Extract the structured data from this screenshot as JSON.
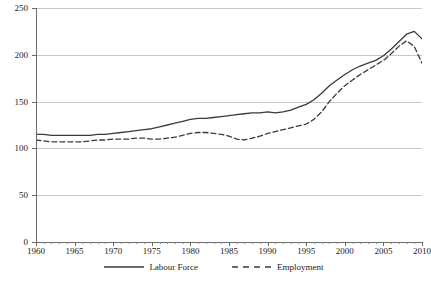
{
  "chart_data": {
    "type": "line",
    "title": "",
    "subtitle": "",
    "xlabel": "",
    "ylabel": "",
    "xlim": [
      1960,
      2010
    ],
    "ylim": [
      0,
      250
    ],
    "yticks": [
      0,
      50,
      100,
      150,
      200,
      250
    ],
    "xticks": [
      1960,
      1965,
      1970,
      1975,
      1980,
      1985,
      1990,
      1995,
      2000,
      2005,
      2010
    ],
    "x_minor_tick_step": 1,
    "grid": "horizontal",
    "legend_position": "bottom",
    "x": [
      1960,
      1961,
      1962,
      1963,
      1964,
      1965,
      1966,
      1967,
      1968,
      1969,
      1970,
      1971,
      1972,
      1973,
      1974,
      1975,
      1976,
      1977,
      1978,
      1979,
      1980,
      1981,
      1982,
      1983,
      1984,
      1985,
      1986,
      1987,
      1988,
      1989,
      1990,
      1991,
      1992,
      1993,
      1994,
      1995,
      1996,
      1997,
      1998,
      1999,
      2000,
      2001,
      2002,
      2003,
      2004,
      2005,
      2006,
      2007,
      2008,
      2009,
      2010
    ],
    "series": [
      {
        "name": "Labour Force",
        "style": "solid",
        "color": "#3a3a3a",
        "values": [
          115,
          115,
          114,
          114,
          114,
          114,
          114,
          114,
          115,
          115,
          116,
          117,
          118,
          119,
          120,
          121,
          123,
          125,
          127,
          129,
          131,
          132,
          132,
          133,
          134,
          135,
          136,
          137,
          138,
          138,
          139,
          138,
          139,
          141,
          144,
          147,
          152,
          159,
          167,
          173,
          179,
          184,
          188,
          191,
          194,
          199,
          206,
          214,
          222,
          225,
          217
        ]
      },
      {
        "name": "Employment",
        "style": "dashed",
        "color": "#3a3a3a",
        "values": [
          109,
          108,
          107,
          107,
          107,
          107,
          107,
          108,
          109,
          109,
          110,
          110,
          110,
          111,
          111,
          110,
          110,
          111,
          112,
          114,
          116,
          117,
          117,
          116,
          115,
          113,
          110,
          109,
          111,
          113,
          116,
          118,
          120,
          122,
          124,
          126,
          131,
          139,
          150,
          159,
          167,
          173,
          179,
          184,
          189,
          194,
          201,
          209,
          215,
          209,
          191
        ]
      }
    ]
  },
  "legend": {
    "entries": [
      {
        "label": "Labour Force",
        "style": "solid"
      },
      {
        "label": "Employment",
        "style": "dashed"
      }
    ]
  },
  "colors": {
    "series_line": "#3a3a3a",
    "gridline": "#c8c8c8",
    "axis": "#6b6b6b",
    "text": "#1a1a1a",
    "background": "#ffffff"
  }
}
